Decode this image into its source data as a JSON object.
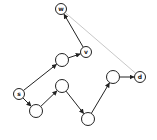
{
  "diagram": {
    "type": "directed-graph",
    "colors": {
      "edge": "#222222",
      "highlight_edge": "#c8c8c8",
      "node_fill": "#ffffff",
      "node_stroke": "#222222"
    },
    "nodes": [
      {
        "id": "w",
        "label": "w",
        "x": 61,
        "y": 9,
        "r": 5.5
      },
      {
        "id": "v",
        "label": "v",
        "x": 86,
        "y": 52,
        "r": 5.5
      },
      {
        "id": "n1",
        "label": "",
        "x": 62,
        "y": 60,
        "r": 6.5
      },
      {
        "id": "s",
        "label": "s",
        "x": 19,
        "y": 94,
        "r": 5.5
      },
      {
        "id": "n2",
        "label": "",
        "x": 36,
        "y": 111,
        "r": 6.5
      },
      {
        "id": "n3",
        "label": "",
        "x": 62,
        "y": 86,
        "r": 6.5
      },
      {
        "id": "n4",
        "label": "",
        "x": 88,
        "y": 119,
        "r": 6.5
      },
      {
        "id": "n5",
        "label": "",
        "x": 113,
        "y": 77,
        "r": 6.5
      },
      {
        "id": "d",
        "label": "d",
        "x": 140,
        "y": 77,
        "r": 5.5
      }
    ],
    "edges": [
      {
        "from": "s",
        "to": "n1",
        "style": "solid"
      },
      {
        "from": "n1",
        "to": "v",
        "style": "solid"
      },
      {
        "from": "v",
        "to": "w",
        "style": "solid"
      },
      {
        "from": "s",
        "to": "n2",
        "style": "solid"
      },
      {
        "from": "n2",
        "to": "n3",
        "style": "solid"
      },
      {
        "from": "n3",
        "to": "n4",
        "style": "solid"
      },
      {
        "from": "n4",
        "to": "n5",
        "style": "solid"
      },
      {
        "from": "n5",
        "to": "d",
        "style": "solid"
      },
      {
        "from": "d",
        "to": "w",
        "style": "gray"
      }
    ]
  }
}
